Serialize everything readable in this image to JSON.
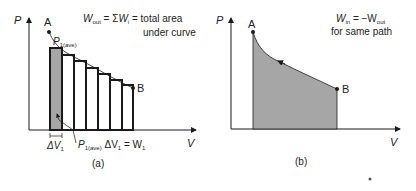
{
  "panel_a": {
    "y_axis_label": "P",
    "x_axis_label": "V",
    "point_a": "A",
    "point_b": "B",
    "equation_line1": "W_out = ΣW_i = total area",
    "equation_line2": "under curve",
    "eq_w": "W",
    "eq_out_sub": "out",
    "eq_mid": " = Σ",
    "eq_wi": "W",
    "eq_i_sub": "i",
    "eq_tail": " = total area",
    "eq_line2": "under curve",
    "p1ave_p": "P",
    "p1ave_sub": "1(ave)",
    "delta_v1": "ΔV",
    "delta_v1_sub": "1",
    "work_p": "P",
    "work_p_sub": "1(ave)",
    "work_dv": " ΔV",
    "work_dv_sub": "1",
    "work_eq": " = W",
    "work_w_sub": "1",
    "caption": "(a)"
  },
  "panel_b": {
    "y_axis_label": "P",
    "x_axis_label": "V",
    "point_a": "A",
    "point_b": "B",
    "eq_w": "W",
    "eq_in_sub": "in",
    "eq_mid": " = −W",
    "eq_out_sub": "out",
    "eq_line2": "for same path",
    "caption": "(b)"
  },
  "colors": {
    "shade": "#a6a6a6",
    "line": "#1a1a1a"
  }
}
